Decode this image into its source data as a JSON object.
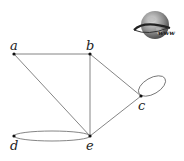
{
  "graph": {
    "nodes": [
      {
        "id": "a",
        "label": "a"
      },
      {
        "id": "b",
        "label": "b"
      },
      {
        "id": "c",
        "label": "c"
      },
      {
        "id": "d",
        "label": "d"
      },
      {
        "id": "e",
        "label": "e"
      }
    ],
    "edges": [
      [
        "a",
        "b"
      ],
      [
        "a",
        "e"
      ],
      [
        "b",
        "e"
      ],
      [
        "b",
        "c"
      ],
      [
        "c",
        "e"
      ],
      [
        "c",
        "c"
      ],
      [
        "d",
        "e"
      ],
      [
        "d",
        "e"
      ]
    ]
  },
  "logo": {
    "text": "www",
    "icon": "globe-icon"
  }
}
